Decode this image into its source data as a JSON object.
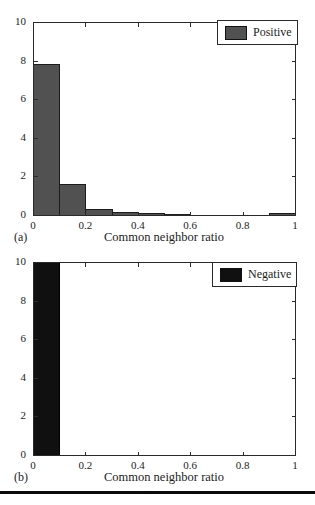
{
  "page": {
    "background": "#ffffff",
    "divider_color": "#0a0a0a",
    "frame_color": "#2a2a2a"
  },
  "chart_data": [
    {
      "type": "bar",
      "panel_label": "(a)",
      "title": "",
      "xlabel": "Common neighbor ratio",
      "ylabel": "",
      "legend_label": "Positive",
      "legend_position": "top-right",
      "bar_color": "#515151",
      "bar_edge_color": "#1c1c1c",
      "bin_edges": [
        0,
        0.1,
        0.2,
        0.3,
        0.4,
        0.5,
        0.6,
        0.7,
        0.8,
        0.9,
        1.0
      ],
      "values": [
        7.8,
        1.6,
        0.33,
        0.15,
        0.1,
        0.07,
        0.02,
        0.02,
        0.02,
        0.12
      ],
      "xlim": [
        0,
        1
      ],
      "ylim": [
        0,
        10
      ],
      "xticks": [
        "0",
        "0.2",
        "0.4",
        "0.6",
        "0.8",
        "1"
      ],
      "yticks": [
        "0",
        "2",
        "4",
        "6",
        "8",
        "10"
      ],
      "grid": false
    },
    {
      "type": "bar",
      "panel_label": "(b)",
      "title": "",
      "xlabel": "Common neighbor ratio",
      "ylabel": "",
      "legend_label": "Negative",
      "legend_position": "top-right",
      "bar_color": "#101010",
      "bar_edge_color": "#000000",
      "bin_edges": [
        0,
        0.1,
        0.2,
        0.3,
        0.4,
        0.5,
        0.6,
        0.7,
        0.8,
        0.9,
        1.0
      ],
      "values": [
        10,
        0,
        0,
        0,
        0,
        0,
        0,
        0,
        0,
        0
      ],
      "xlim": [
        0,
        1
      ],
      "ylim": [
        0,
        10
      ],
      "xticks": [
        "0",
        "0.2",
        "0.4",
        "0.6",
        "0.8",
        "1"
      ],
      "yticks": [
        "0",
        "2",
        "4",
        "6",
        "8",
        "10"
      ],
      "grid": false
    }
  ]
}
